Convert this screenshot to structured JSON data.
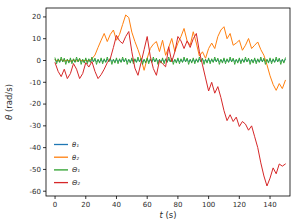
{
  "chart_data": {
    "type": "line",
    "title": "",
    "xlabel": "t (s)",
    "ylabel": "θ (rad/s)",
    "xlim": [
      -5.9,
      153.0
    ],
    "ylim": [
      -62.2,
      24.1
    ],
    "x_ticks": [
      0,
      20,
      40,
      60,
      80,
      100,
      120,
      140
    ],
    "y_ticks": [
      20,
      10,
      0,
      -10,
      -20,
      -30,
      -40,
      -50,
      -60
    ],
    "grid": false,
    "legend_position": "lower left",
    "axis_color": "#000000",
    "tick_label_color": "#2b2b2b",
    "background_color": "#ffffff",
    "series": [
      {
        "name": "θ₁",
        "color": "#1f77b4",
        "x_start": 0,
        "x_step": 1,
        "values": [
          0.5,
          -0.6,
          0.4,
          -0.7,
          0.6,
          -0.4,
          0.5,
          -0.5,
          0.3,
          -0.6,
          0.5,
          -0.6,
          0.4,
          -0.7,
          0.6,
          -0.4,
          0.5,
          -0.5,
          0.3,
          -0.6,
          0.5,
          -0.6,
          0.4,
          -0.7,
          0.6,
          -0.4,
          0.5,
          -0.5,
          0.3,
          -0.6,
          0.5,
          -0.6,
          0.4,
          -0.7,
          0.6,
          -0.4,
          0.5,
          -0.5,
          0.3,
          -0.6,
          0.5,
          -0.6,
          0.4,
          -0.7,
          0.6,
          -0.4,
          0.5,
          -0.5,
          0.3,
          -0.6,
          0.5,
          -0.6,
          0.4,
          -0.7,
          0.6,
          -0.4,
          0.5,
          -0.5,
          0.3,
          -0.6,
          0.5,
          -0.6,
          0.4,
          -0.7,
          0.6,
          -0.4,
          0.5,
          -0.5,
          0.3,
          -0.6,
          0.5,
          -0.6,
          0.4,
          -0.7,
          0.6,
          -0.4,
          0.5,
          -0.5,
          0.3,
          -0.6,
          0.5,
          -0.6,
          0.4,
          -0.7,
          0.6,
          -0.4,
          0.5,
          -0.5,
          0.3,
          -0.6,
          0.5,
          -0.6,
          0.4,
          -0.7,
          0.6,
          -0.4,
          0.5,
          -0.5,
          0.3,
          -0.6,
          0.5,
          -0.6,
          0.4,
          -0.7,
          0.6,
          -0.4,
          0.5,
          -0.5,
          0.3,
          -0.6,
          0.5,
          -0.6,
          0.4,
          -0.7,
          0.6,
          -0.4,
          0.5,
          -0.5,
          0.3,
          -0.6,
          0.5,
          -0.6,
          0.4,
          -0.7,
          0.6,
          -0.4,
          0.5,
          -0.5,
          0.3,
          -0.6,
          0.5,
          -0.6,
          0.4,
          -0.7,
          0.6,
          -0.4,
          0.5,
          -0.5,
          0.3,
          -0.6,
          0.5,
          -0.6,
          0.4,
          -0.7,
          0.6,
          -0.4,
          0.5,
          -0.5,
          0.3,
          -0.6,
          0.5
        ]
      },
      {
        "name": "θ₂",
        "color": "#ff7f0e",
        "x_start": 0,
        "x_step": 2,
        "values": [
          0.3,
          -0.2,
          0.4,
          -0.3,
          0.2,
          -0.4,
          0.3,
          -0.2,
          0.4,
          -0.3,
          0.2,
          -0.3,
          0.8,
          2.5,
          6,
          9.3,
          12.4,
          8.7,
          12,
          14,
          9.3,
          12,
          16.5,
          20.9,
          19.7,
          13,
          8.7,
          5,
          0.9,
          -4.5,
          1,
          5.5,
          7.5,
          8.7,
          4.1,
          9.3,
          2.4,
          6,
          10.1,
          4.1,
          8,
          11,
          14.7,
          9,
          7,
          13.2,
          8,
          2,
          4,
          1,
          5.5,
          8,
          5.5,
          11,
          14,
          15.5,
          10,
          12.4,
          7,
          8,
          9.3,
          4.7,
          7,
          10.1,
          5.5,
          7,
          8.5,
          5,
          2.4,
          -2,
          -7,
          -11,
          -13.7,
          -10.6,
          -12.9,
          -9.1
        ]
      },
      {
        "name": "Θ₁",
        "color": "#2ca02c",
        "x_start": 0,
        "x_step": 1,
        "values": [
          1.2,
          -1.5,
          0.8,
          -0.9,
          1.6,
          -0.7,
          1.1,
          -1.8,
          0.6,
          -1.2,
          1.2,
          -1.5,
          0.8,
          -0.9,
          1.6,
          -0.7,
          1.1,
          -1.8,
          0.6,
          -1.2,
          1.2,
          -1.5,
          0.8,
          -0.9,
          1.6,
          -0.7,
          1.1,
          -1.8,
          0.6,
          -1.2,
          1.2,
          -1.5,
          0.8,
          -0.9,
          1.6,
          -0.7,
          1.1,
          -1.8,
          0.6,
          -1.2,
          1.2,
          -1.5,
          0.8,
          -0.9,
          1.6,
          -0.7,
          1.1,
          -1.8,
          0.6,
          -1.2,
          1.2,
          -1.5,
          0.8,
          -0.9,
          1.6,
          -0.7,
          1.1,
          -1.8,
          0.6,
          -1.2,
          1.2,
          -1.5,
          0.8,
          -0.9,
          1.6,
          -0.7,
          1.1,
          -1.8,
          0.6,
          -1.2,
          1.2,
          -1.5,
          0.8,
          -0.9,
          1.6,
          -0.7,
          1.1,
          -1.8,
          0.6,
          -1.2,
          1.2,
          -1.5,
          0.8,
          -0.9,
          1.6,
          -0.7,
          1.1,
          -1.8,
          0.6,
          -1.2,
          1.2,
          -1.5,
          0.8,
          -0.9,
          1.6,
          -0.7,
          1.1,
          -1.8,
          0.6,
          -1.2,
          1.2,
          -1.5,
          0.8,
          -0.9,
          1.6,
          -0.7,
          1.1,
          -1.8,
          0.6,
          -1.2,
          1.2,
          -1.5,
          0.8,
          -0.9,
          1.6,
          -0.7,
          1.1,
          -1.8,
          0.6,
          -1.2,
          1.2,
          -1.5,
          0.8,
          -0.9,
          1.6,
          -0.7,
          1.1,
          -1.8,
          0.6,
          -1.2,
          1.2,
          -1.5,
          0.8,
          -0.9,
          1.6,
          -0.7,
          1.1,
          -1.8,
          0.6,
          -1.2,
          1.2,
          -1.5,
          0.8,
          -0.9,
          1.6,
          -0.7,
          1.1,
          -1.8,
          0.6,
          -1.2,
          1.2
        ]
      },
      {
        "name": "Θ₂",
        "color": "#d62728",
        "x_start": 0,
        "x_step": 2,
        "values": [
          -1,
          -5,
          -7.4,
          -4,
          -8.3,
          -6,
          -1.4,
          -4,
          -8.3,
          -6,
          -1,
          -3,
          -0.5,
          -5,
          -8.3,
          -6.5,
          -4,
          -1,
          0.9,
          6,
          11.5,
          9,
          7.8,
          11,
          13.3,
          4,
          -3.5,
          -6.8,
          -1,
          5,
          11,
          2,
          -3.7,
          -6.8,
          0,
          -1.5,
          -2.9,
          6.3,
          -0.6,
          4,
          11,
          9,
          5.5,
          9,
          6,
          10,
          12.4,
          4,
          -2,
          -8,
          -14,
          -10,
          -15,
          -12,
          -17,
          -23,
          -27.6,
          -24.9,
          -28,
          -26,
          -30.3,
          -28,
          -29.2,
          -32,
          -30,
          -35,
          -40,
          -47,
          -53,
          -57.6,
          -54,
          -49.3,
          -52,
          -47.5,
          -48.5,
          -47.5
        ]
      }
    ]
  }
}
